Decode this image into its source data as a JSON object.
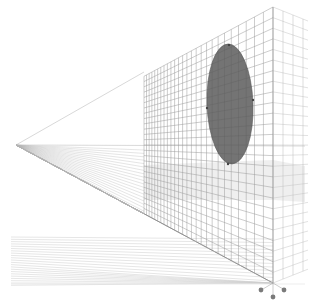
{
  "diagram": {
    "kind": "two-point perspective grid",
    "colors": {
      "background": "#ffffff",
      "grid": "#9a9a9a",
      "grid_light": "#cfcfcf",
      "shade": "#e4e4e4",
      "ellipse_fill": "#6f6f6f",
      "ellipse_stroke": "#555555",
      "handle": "#7a7a7a",
      "edge": "#666666"
    },
    "left_vanishing_point": {
      "x": 16,
      "y": 145
    },
    "horizon_y": 146,
    "front_corner": {
      "x": 273,
      "top_y": 7,
      "bottom_y": 283
    },
    "front_wall": {
      "left_x": 144,
      "top_y": 72,
      "bottom_y": 214
    },
    "right_wall": {
      "right_x": 305,
      "top_y": 30,
      "bottom_y": 262
    },
    "ellipse": {
      "cx": 230,
      "cy": 104,
      "rx": 23,
      "ry": 60,
      "rotation": -2
    },
    "handles": [
      {
        "name": "handle-left",
        "x": 261,
        "y": 290
      },
      {
        "name": "handle-right",
        "x": 284,
        "y": 290
      },
      {
        "name": "handle-bottom",
        "x": 273,
        "y": 297
      }
    ]
  }
}
